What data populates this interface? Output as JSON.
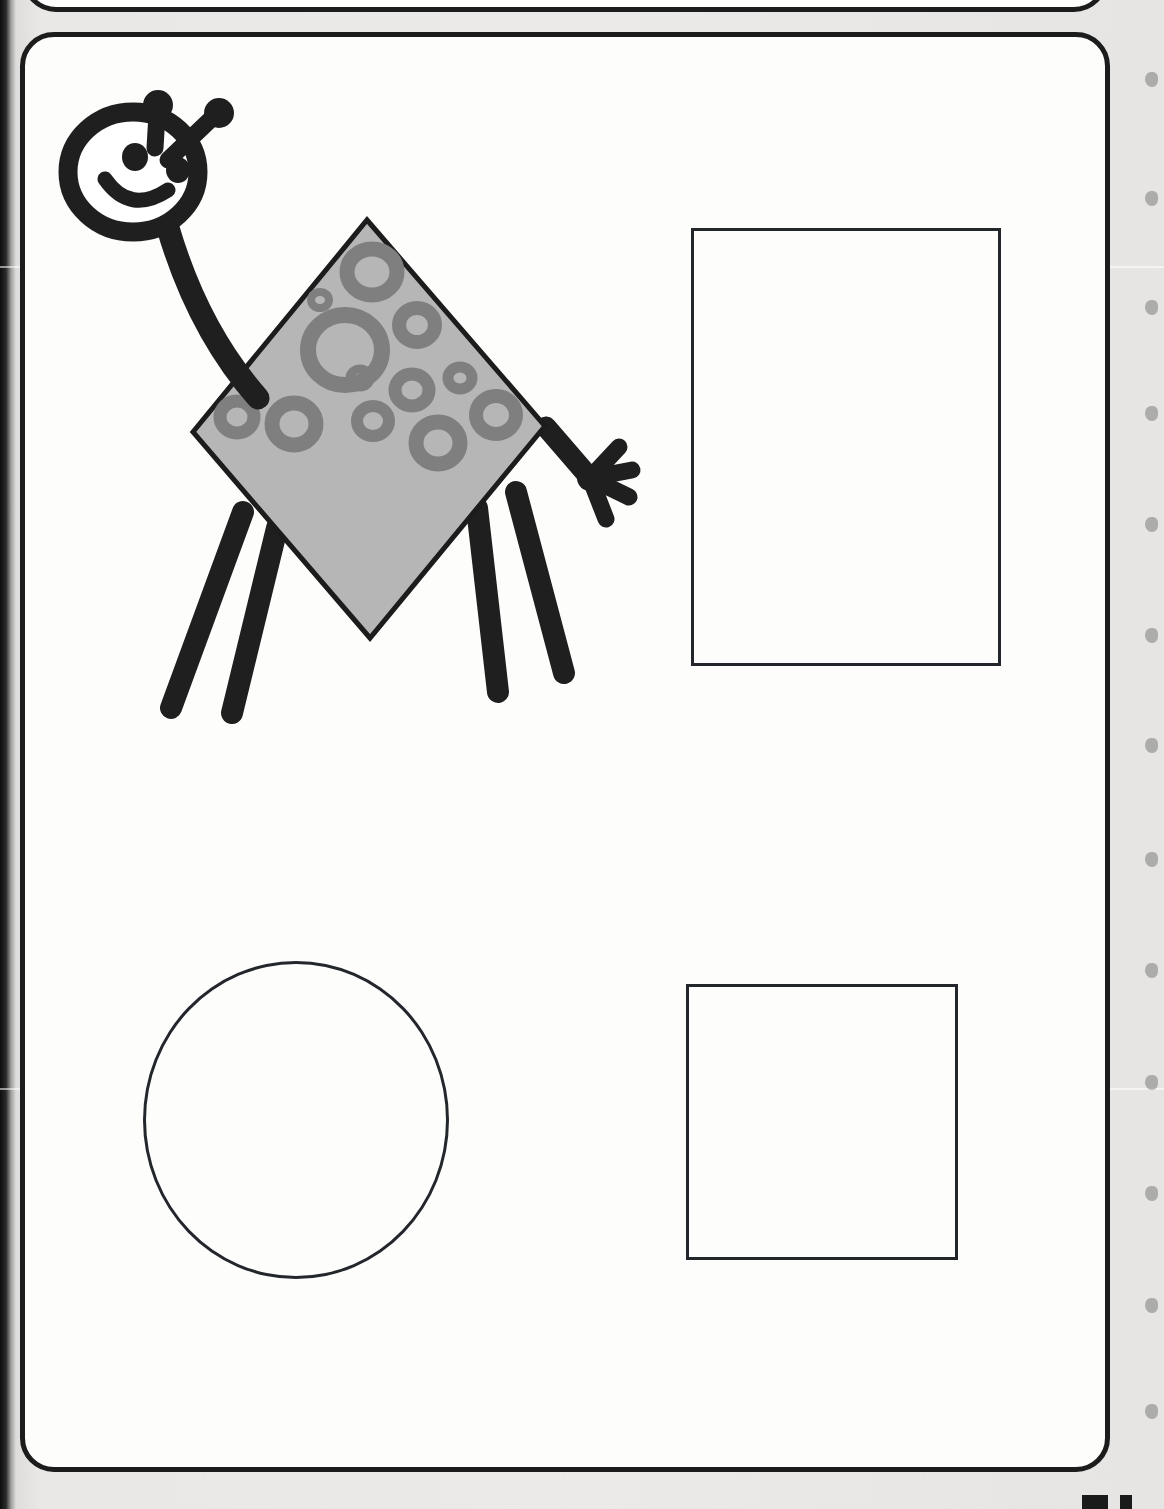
{
  "page": {
    "kind": "scanned-workbook-page",
    "width": 1164,
    "height": 1509,
    "background_color": "#e9e8e6",
    "paper_color": "#fdfdfc",
    "ink_color": "#1c1c1c",
    "title_text": "",
    "instruction_text": "",
    "page_number_text": ""
  },
  "frames": [
    {
      "name": "previous-exercise-frame",
      "label": "partial rounded frame cut off at top of page",
      "x": 22,
      "y": -78,
      "width": 1086,
      "height": 90,
      "border_color": "#1c1c1c",
      "border_width": 5,
      "corner_radius": 34
    },
    {
      "name": "main-exercise-frame",
      "label": "main rounded exercise frame",
      "x": 20,
      "y": 32,
      "width": 1090,
      "height": 1440,
      "border_color": "#1c1c1c",
      "border_width": 5,
      "corner_radius": 34
    }
  ],
  "creature": {
    "name": "diamond-body-alien",
    "description": "cartoon alien bug with round smiling head, two antennae, long curved neck, diamond-shaped spotted body, four legs and one arm with a four-fingered hand",
    "stroke_color": "#1f1f1f",
    "body_fill_color": "#b6b6b6",
    "body_outline_color": "#1c1c1c",
    "spot_color": "#7f7f7f",
    "shape_of_body": "diamond",
    "spot_shape": "ring",
    "spot_count": 12,
    "leg_count": 4,
    "arm_count": 1,
    "finger_count": 4,
    "antenna_count": 2,
    "eye_count": 2,
    "body_corners": {
      "top": [
        367,
        220
      ],
      "right": [
        545,
        426
      ],
      "bottom": [
        370,
        638
      ],
      "left": [
        193,
        432
      ]
    },
    "head_center": [
      133,
      172
    ],
    "head_radius_x": 65,
    "head_radius_y": 60
  },
  "answer_shapes": [
    {
      "name": "rectangle-tall",
      "shape": "rectangle",
      "x": 691,
      "y": 228,
      "width": 310,
      "height": 438,
      "stroke_color": "#23262b",
      "stroke_width": 3,
      "fill": "none"
    },
    {
      "name": "circle",
      "shape": "circle",
      "x": 143,
      "y": 961,
      "width": 306,
      "height": 318,
      "stroke_color": "#23262b",
      "stroke_width": 3,
      "fill": "none"
    },
    {
      "name": "square",
      "shape": "square",
      "x": 686,
      "y": 984,
      "width": 272,
      "height": 276,
      "stroke_color": "#23262b",
      "stroke_width": 3,
      "fill": "none"
    }
  ],
  "binding_marks": {
    "name": "spiral-binding-marks",
    "color": "rgba(40,40,40,0.30)",
    "y_positions": [
      72,
      191,
      300,
      406,
      517,
      628,
      738,
      852,
      963,
      1075,
      1186,
      1298,
      1404
    ]
  },
  "page_number_marks": {
    "name": "cut-off-page-number",
    "marks": [
      {
        "x": 1082,
        "width": 26
      },
      {
        "x": 1120,
        "width": 12
      }
    ]
  },
  "scan_seams": [
    {
      "y": 266
    },
    {
      "y": 1088
    }
  ]
}
